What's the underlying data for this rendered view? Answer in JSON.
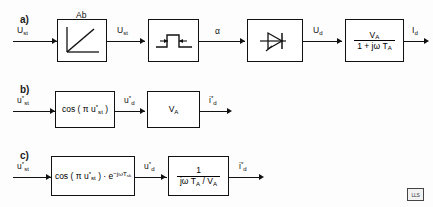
{
  "figure": {
    "rows": [
      {
        "id": "a",
        "label": "a)",
        "input_signal": "U",
        "input_sub": "st",
        "input_sup": "",
        "blocks": [
          {
            "name": "ramp-characteristic",
            "caption": "Ab",
            "icon": "ramp-curve-icon",
            "out_signal": "U",
            "out_sub": "st",
            "out_sup": ""
          },
          {
            "name": "pulse-generator",
            "caption": "",
            "icon": "pulse-width-icon",
            "out_signal": "α",
            "out_sub": "",
            "out_sup": ""
          },
          {
            "name": "thyristor-converter",
            "caption": "",
            "icon": "thyristor-icon",
            "out_signal": "U",
            "out_sub": "d",
            "out_sup": ""
          },
          {
            "name": "load-transfer-function",
            "caption": "",
            "icon": "fraction",
            "numerator": "V",
            "numerator_sub": "A",
            "denominator": "1 + jω T",
            "denominator_sub": "A",
            "out_signal": "I",
            "out_sub": "d",
            "out_sup": ""
          }
        ]
      },
      {
        "id": "b",
        "label": "b)",
        "input_signal": "u",
        "input_sub": "st",
        "input_sup": "*",
        "blocks": [
          {
            "name": "cosine-control-law",
            "caption": "",
            "icon": "text",
            "text_prefix": "cos ( π u",
            "text_sub": "st",
            "text_sup": "*",
            "text_suffix": " )",
            "out_signal": "u",
            "out_sub": "d",
            "out_sup": "*"
          },
          {
            "name": "gain-va",
            "caption": "",
            "icon": "gain",
            "gain_symbol": "V",
            "gain_sub": "A",
            "out_signal": "i",
            "out_sub": "d",
            "out_sup": "*"
          }
        ]
      },
      {
        "id": "c",
        "label": "c)",
        "input_signal": "u",
        "input_sub": "st",
        "input_sup": "*",
        "blocks": [
          {
            "name": "cosine-control-law-with-deadtime",
            "caption": "",
            "icon": "text-exp",
            "text_prefix": "cos ( π u",
            "text_sub": "st",
            "text_sup": "*",
            "text_suffix": " ) · e",
            "exponent": "−jωT",
            "exponent_sub": "sk",
            "out_signal": "u",
            "out_sub": "d",
            "out_sup": "*"
          },
          {
            "name": "inverse-impedance",
            "caption": "",
            "icon": "fraction",
            "numerator": "1",
            "numerator_sub": "",
            "denominator": "jω T",
            "denominator_sub": "A",
            "denominator_tail": " / V",
            "denominator_tail_sub": "A",
            "out_signal": "i",
            "out_sub": "d",
            "out_sup": "*"
          }
        ]
      }
    ],
    "corner_stamp": "LLS"
  }
}
